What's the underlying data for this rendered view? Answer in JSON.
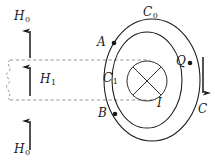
{
  "figure": {
    "background_color": "#ffffff",
    "line_color": "#1a1a1a",
    "dash_color": "#8a8a8a",
    "width": 215,
    "height": 164
  },
  "labels": {
    "h0_top": "H",
    "h0_top_sub": "0",
    "h1": "H",
    "h1_sub": "1",
    "h0_bottom": "H",
    "h0_bottom_sub": "0",
    "c0": "C",
    "c0_sub": "0",
    "c1": "C",
    "c1_sub": "1",
    "point_a": "A",
    "point_b": "B",
    "point_q": "Q",
    "current_i": "I",
    "contour_c": "C"
  },
  "elements": {
    "arrow_h0_top": {
      "direction": "up",
      "x": 30,
      "y_tail": 58,
      "y_head": 28
    },
    "arrow_h1": {
      "direction": "up",
      "x": 30,
      "y_tail": 96,
      "y_head": 64
    },
    "arrow_h0_bottom": {
      "direction": "up",
      "x": 30,
      "y_tail": 150,
      "y_head": 118
    },
    "arrow_c_right": {
      "direction": "down",
      "x": 203,
      "y_tail": 58,
      "y_head": 96
    },
    "dashed_box": {
      "x": 8,
      "y": 60,
      "width": 142,
      "height": 40,
      "left_edge": "wavy"
    },
    "outer_ellipse": {
      "cx": 152,
      "cy": 80,
      "rx": 48,
      "ry": 61,
      "name": "C0"
    },
    "inner_ellipse": {
      "cx": 147,
      "cy": 80,
      "rx": 35,
      "ry": 48,
      "name": "C1"
    },
    "current_circle": {
      "cx": 147,
      "cy": 81,
      "r": 20,
      "marker": "cross-into-page"
    },
    "point_dots": [
      {
        "name": "A",
        "cx": 114,
        "cy": 43
      },
      {
        "name": "B",
        "cx": 115,
        "cy": 114
      },
      {
        "name": "Q",
        "cx": 190,
        "cy": 63
      }
    ]
  }
}
